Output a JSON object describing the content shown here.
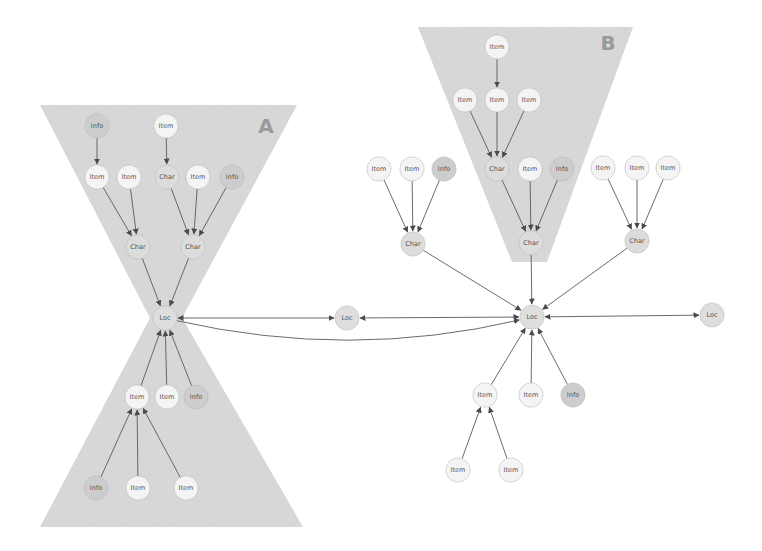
{
  "colors": {
    "background": "#ffffff",
    "region_fill": "#d9d9d9",
    "edge": "#5a5a5a",
    "node_border": "#b8b8b8",
    "region_label": "#9a9a9a",
    "node_fill": {
      "Info": "#cdcdcd",
      "Char": "#dcdcdc",
      "Loc": "#dedede",
      "Item": "#f4f4f4"
    }
  },
  "regions": [
    {
      "id": "A",
      "label": "A",
      "shape": "hourglass",
      "points": [
        [
          40,
          105
        ],
        [
          297,
          105
        ],
        [
          182,
          318
        ],
        [
          303,
          527
        ],
        [
          40,
          527
        ],
        [
          150,
          318
        ]
      ],
      "label_pos": [
        266,
        133
      ]
    },
    {
      "id": "B",
      "label": "B",
      "shape": "trapezoid",
      "points": [
        [
          418,
          27
        ],
        [
          633,
          27
        ],
        [
          547,
          262
        ],
        [
          512,
          262
        ]
      ],
      "label_pos": [
        608,
        50
      ]
    }
  ],
  "node_radius": 12,
  "nodes": [
    {
      "id": "a_info1",
      "label": "Info",
      "type": "Info",
      "x": 97,
      "y": 126
    },
    {
      "id": "a_item1",
      "label": "Item",
      "type": "Item",
      "x": 166,
      "y": 126
    },
    {
      "id": "a_item2",
      "label": "Item",
      "type": "Item",
      "x": 97,
      "y": 177
    },
    {
      "id": "a_item3",
      "label": "Item",
      "type": "Item",
      "x": 129,
      "y": 177
    },
    {
      "id": "a_char1",
      "label": "Char",
      "type": "Char",
      "x": 167,
      "y": 177
    },
    {
      "id": "a_item4",
      "label": "Item",
      "type": "Item",
      "x": 198,
      "y": 177
    },
    {
      "id": "a_info2",
      "label": "Info",
      "type": "Info",
      "x": 232,
      "y": 177
    },
    {
      "id": "a_char2",
      "label": "Char",
      "type": "Char",
      "x": 138,
      "y": 247
    },
    {
      "id": "a_char3",
      "label": "Char",
      "type": "Char",
      "x": 193,
      "y": 247
    },
    {
      "id": "a_loc",
      "label": "Loc",
      "type": "Loc",
      "x": 165,
      "y": 318
    },
    {
      "id": "a_item5",
      "label": "Item",
      "type": "Item",
      "x": 137,
      "y": 397
    },
    {
      "id": "a_item6",
      "label": "Item",
      "type": "Item",
      "x": 167,
      "y": 397
    },
    {
      "id": "a_info3",
      "label": "Info",
      "type": "Info",
      "x": 196,
      "y": 397
    },
    {
      "id": "a_info4",
      "label": "Info",
      "type": "Info",
      "x": 96,
      "y": 488
    },
    {
      "id": "a_item7",
      "label": "Item",
      "type": "Item",
      "x": 138,
      "y": 488
    },
    {
      "id": "a_item8",
      "label": "Item",
      "type": "Item",
      "x": 186,
      "y": 488
    },
    {
      "id": "m_loc",
      "label": "Loc",
      "type": "Loc",
      "x": 347,
      "y": 318
    },
    {
      "id": "b_item1",
      "label": "Item",
      "type": "Item",
      "x": 497,
      "y": 47
    },
    {
      "id": "b_item2",
      "label": "Item",
      "type": "Item",
      "x": 465,
      "y": 100
    },
    {
      "id": "b_item3",
      "label": "Item",
      "type": "Item",
      "x": 497,
      "y": 100
    },
    {
      "id": "b_item4",
      "label": "Item",
      "type": "Item",
      "x": 529,
      "y": 100
    },
    {
      "id": "b_char1",
      "label": "Char",
      "type": "Char",
      "x": 497,
      "y": 169
    },
    {
      "id": "b_item5",
      "label": "Item",
      "type": "Item",
      "x": 530,
      "y": 169
    },
    {
      "id": "b_info1",
      "label": "Info",
      "type": "Info",
      "x": 562,
      "y": 169
    },
    {
      "id": "b_char2",
      "label": "Char",
      "type": "Char",
      "x": 531,
      "y": 243
    },
    {
      "id": "l_item1",
      "label": "Item",
      "type": "Item",
      "x": 379,
      "y": 169
    },
    {
      "id": "l_item2",
      "label": "Item",
      "type": "Item",
      "x": 412,
      "y": 169
    },
    {
      "id": "l_info1",
      "label": "Info",
      "type": "Info",
      "x": 444,
      "y": 169
    },
    {
      "id": "l_char",
      "label": "Char",
      "type": "Char",
      "x": 413,
      "y": 244
    },
    {
      "id": "r_item1",
      "label": "Item",
      "type": "Item",
      "x": 603,
      "y": 168
    },
    {
      "id": "r_item2",
      "label": "Item",
      "type": "Item",
      "x": 637,
      "y": 168
    },
    {
      "id": "r_item3",
      "label": "Item",
      "type": "Item",
      "x": 668,
      "y": 168
    },
    {
      "id": "r_char",
      "label": "Char",
      "type": "Char",
      "x": 637,
      "y": 241
    },
    {
      "id": "b_loc",
      "label": "Loc",
      "type": "Loc",
      "x": 532,
      "y": 317
    },
    {
      "id": "f_loc",
      "label": "Loc",
      "type": "Loc",
      "x": 712,
      "y": 315
    },
    {
      "id": "c_item1",
      "label": "Item",
      "type": "Item",
      "x": 485,
      "y": 395
    },
    {
      "id": "c_item2",
      "label": "Item",
      "type": "Item",
      "x": 531,
      "y": 395
    },
    {
      "id": "c_info1",
      "label": "Info",
      "type": "Info",
      "x": 573,
      "y": 395
    },
    {
      "id": "c_item3",
      "label": "Item",
      "type": "Item",
      "x": 458,
      "y": 470
    },
    {
      "id": "c_item4",
      "label": "Item",
      "type": "Item",
      "x": 511,
      "y": 470
    }
  ],
  "edges": [
    {
      "from": "a_info1",
      "to": "a_item2"
    },
    {
      "from": "a_item1",
      "to": "a_char1"
    },
    {
      "from": "a_item2",
      "to": "a_char2"
    },
    {
      "from": "a_item3",
      "to": "a_char2"
    },
    {
      "from": "a_char1",
      "to": "a_char3"
    },
    {
      "from": "a_item4",
      "to": "a_char3"
    },
    {
      "from": "a_info2",
      "to": "a_char3"
    },
    {
      "from": "a_char2",
      "to": "a_loc"
    },
    {
      "from": "a_char3",
      "to": "a_loc"
    },
    {
      "from": "a_item5",
      "to": "a_loc"
    },
    {
      "from": "a_item6",
      "to": "a_loc"
    },
    {
      "from": "a_info3",
      "to": "a_loc"
    },
    {
      "from": "a_info4",
      "to": "a_item5"
    },
    {
      "from": "a_item7",
      "to": "a_item5"
    },
    {
      "from": "a_item8",
      "to": "a_item5"
    },
    {
      "from": "a_loc",
      "to": "m_loc",
      "bidirectional": true
    },
    {
      "from": "m_loc",
      "to": "b_loc",
      "bidirectional": true
    },
    {
      "from": "a_loc",
      "to": "b_loc",
      "curve": [
        350,
        360
      ]
    },
    {
      "from": "b_item1",
      "to": "b_item3"
    },
    {
      "from": "b_item2",
      "to": "b_char1"
    },
    {
      "from": "b_item3",
      "to": "b_char1"
    },
    {
      "from": "b_item4",
      "to": "b_char1"
    },
    {
      "from": "b_char1",
      "to": "b_char2"
    },
    {
      "from": "b_item5",
      "to": "b_char2"
    },
    {
      "from": "b_info1",
      "to": "b_char2"
    },
    {
      "from": "b_char2",
      "to": "b_loc"
    },
    {
      "from": "l_item1",
      "to": "l_char"
    },
    {
      "from": "l_item2",
      "to": "l_char"
    },
    {
      "from": "l_info1",
      "to": "l_char"
    },
    {
      "from": "l_char",
      "to": "b_loc"
    },
    {
      "from": "r_item1",
      "to": "r_char"
    },
    {
      "from": "r_item2",
      "to": "r_char"
    },
    {
      "from": "r_item3",
      "to": "r_char"
    },
    {
      "from": "r_char",
      "to": "b_loc"
    },
    {
      "from": "b_loc",
      "to": "f_loc",
      "bidirectional": true
    },
    {
      "from": "c_item1",
      "to": "b_loc"
    },
    {
      "from": "c_item2",
      "to": "b_loc"
    },
    {
      "from": "c_info1",
      "to": "b_loc"
    },
    {
      "from": "c_item3",
      "to": "c_item1"
    },
    {
      "from": "c_item4",
      "to": "c_item1"
    }
  ]
}
